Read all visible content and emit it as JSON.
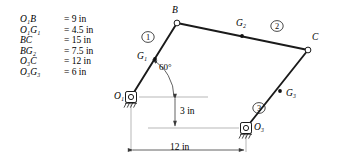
{
  "figure": {
    "background_color": "#ffffff",
    "line_color": "#1a1a1a",
    "dimension_line_color": "#808080"
  },
  "dimensions_list": [
    {
      "symbol_main": "O",
      "symbol_sub1": "1",
      "symbol_rest": "B",
      "value": "= 9 in"
    },
    {
      "symbol_main": "O",
      "symbol_sub1": "1",
      "symbol_rest": "G",
      "symbol_sub2": "1",
      "value": "= 4.5 in"
    },
    {
      "symbol_main": "BC",
      "value": "= 15 in"
    },
    {
      "symbol_main": "BG",
      "symbol_sub2": "2",
      "value": "= 7.5 in"
    },
    {
      "symbol_main": "O",
      "symbol_sub1": "3",
      "symbol_rest": "C",
      "value": "= 12 in"
    },
    {
      "symbol_main": "O",
      "symbol_sub1": "3",
      "symbol_rest": "G",
      "symbol_sub2": "3",
      "value": "= 6 in"
    }
  ],
  "dimension_rows": {
    "r0_sym": "O₁B",
    "r0_val": "= 9 in",
    "r1_sym": "O₁G₁",
    "r1_val": "= 4.5 in",
    "r2_sym": "BC",
    "r2_val": "= 15 in",
    "r3_sym": "BG₂",
    "r3_val": "= 7.5 in",
    "r4_sym": "O₃C",
    "r4_val": "= 12 in",
    "r5_sym": "O₃G₃",
    "r5_val": "= 6 in"
  },
  "joints": [
    {
      "name": "O1",
      "label": "O₁",
      "type": "ground-pivot",
      "x": 131,
      "y": 97
    },
    {
      "name": "B",
      "label": "B",
      "type": "pin-joint",
      "x": 177,
      "y": 23
    },
    {
      "name": "C",
      "label": "C",
      "type": "pin-joint",
      "x": 308,
      "y": 50
    },
    {
      "name": "O3",
      "label": "O₃",
      "type": "ground-pivot",
      "x": 246,
      "y": 128
    }
  ],
  "mass_centers": [
    {
      "name": "G1",
      "label": "G₁",
      "on_link": "1",
      "x": 155,
      "y": 59
    },
    {
      "name": "G2",
      "label": "G₂",
      "on_link": "2",
      "x": 242,
      "y": 36
    },
    {
      "name": "G3",
      "label": "G₃",
      "on_link": "3",
      "x": 280,
      "y": 91
    }
  ],
  "links": [
    {
      "number": "①",
      "from": "O1",
      "to": "B",
      "badge_x": 148,
      "badge_y": 37
    },
    {
      "number": "②",
      "from": "B",
      "to": "C",
      "badge_x": 277,
      "badge_y": 28
    },
    {
      "number": "③",
      "from": "O3",
      "to": "C",
      "badge_x": 259,
      "badge_y": 108
    }
  ],
  "angle": {
    "label": "60°",
    "value_degrees": 60,
    "vertex": "O₁",
    "from_ray": "horizontal",
    "to_ray": "link-1",
    "label_x": 159,
    "label_y": 70
  },
  "linear_dimensions": [
    {
      "name": "vertical-offset",
      "label": "3 in",
      "value": 3,
      "unit": "in",
      "orientation": "vertical",
      "label_x": 155,
      "label_y": 106
    },
    {
      "name": "horizontal-span",
      "label": "12 in",
      "value": 12,
      "unit": "in",
      "orientation": "horizontal",
      "label_x": 172,
      "label_y": 145
    }
  ]
}
